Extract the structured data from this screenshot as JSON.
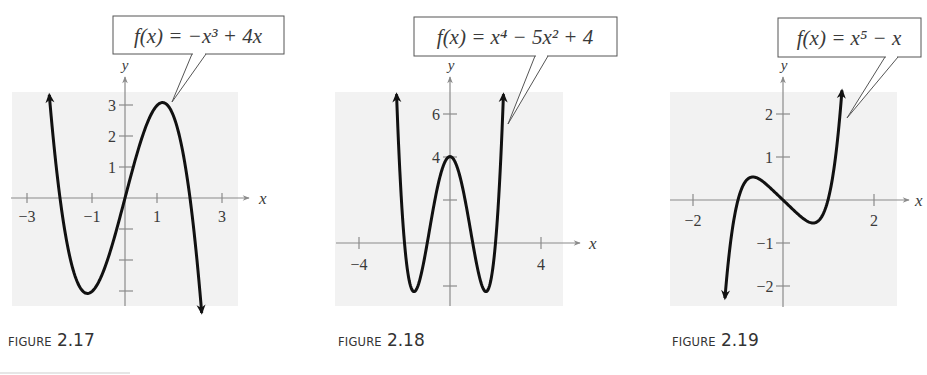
{
  "figures": [
    {
      "caption_word": "FIGURE",
      "caption_number": "2.17",
      "equation_label": "f(x) = −x³ + 4x",
      "axis_labels": {
        "x": "x",
        "y": "y"
      },
      "x_ticks": [
        "−3",
        "−1",
        "1",
        "3"
      ],
      "y_ticks": [
        "3",
        "2",
        "1"
      ]
    },
    {
      "caption_word": "FIGURE",
      "caption_number": "2.18",
      "equation_label": "f(x) = x⁴ − 5x² + 4",
      "axis_labels": {
        "x": "x",
        "y": "y"
      },
      "x_ticks": [
        "−4",
        "4"
      ],
      "y_ticks": [
        "6",
        "4"
      ]
    },
    {
      "caption_word": "FIGURE",
      "caption_number": "2.19",
      "equation_label": "f(x) = x⁵ − x",
      "axis_labels": {
        "x": "x",
        "y": "y"
      },
      "x_ticks": [
        "−2",
        "2"
      ],
      "y_ticks": [
        "2",
        "1",
        "−1",
        "−2"
      ]
    }
  ],
  "colors": {
    "plot_background": "#f2f2f2",
    "axis": "#8a8a8a",
    "curve": "#111111",
    "text": "#3a3a3a"
  },
  "chart_data": [
    {
      "type": "line",
      "title": "FIGURE 2.17",
      "function": "f(x) = -x^3 + 4x",
      "xlabel": "x",
      "ylabel": "y",
      "xlim": [
        -3.5,
        3.5
      ],
      "ylim": [
        -3.5,
        3.5
      ],
      "x_tick_labels": [
        -3,
        -1,
        1,
        3
      ],
      "x_ticks": [
        -3,
        -2,
        -1,
        1,
        2,
        3
      ],
      "y_tick_labels": [
        1,
        2,
        3
      ],
      "y_ticks": [
        -3,
        -2,
        -1,
        1,
        2,
        3
      ],
      "grid": false,
      "x": [
        -2.3,
        -2,
        -1.5,
        -1.155,
        -1,
        -0.5,
        0,
        0.5,
        1,
        1.155,
        1.5,
        2,
        2.35
      ],
      "y": [
        2.97,
        0,
        -2.625,
        -3.08,
        -3,
        -1.875,
        0,
        1.875,
        3,
        3.08,
        2.625,
        0,
        -3.58
      ],
      "annotations": [
        "f(x) = −x³ + 4x"
      ]
    },
    {
      "type": "line",
      "title": "FIGURE 2.18",
      "function": "f(x) = x^4 - 5x^2 + 4",
      "xlabel": "x",
      "ylabel": "y",
      "xlim": [
        -5,
        5
      ],
      "ylim": [
        -3,
        7
      ],
      "x_tick_labels": [
        -4,
        4
      ],
      "x_ticks": [
        -4,
        4
      ],
      "y_tick_labels": [
        4,
        6
      ],
      "y_ticks": [
        -2,
        2,
        4,
        6
      ],
      "grid": false,
      "x": [
        -2.35,
        -2,
        -1.58,
        -1,
        0,
        1,
        1.58,
        2,
        2.35
      ],
      "y": [
        6.89,
        0,
        -2.25,
        0,
        4,
        0,
        -2.25,
        0,
        6.89
      ],
      "annotations": [
        "f(x) = x⁴ − 5x² + 4"
      ]
    },
    {
      "type": "line",
      "title": "FIGURE 2.19",
      "function": "f(x) = x^5 - x",
      "xlabel": "x",
      "ylabel": "y",
      "xlim": [
        -2.5,
        2.5
      ],
      "ylim": [
        -2.5,
        2.5
      ],
      "x_tick_labels": [
        -2,
        2
      ],
      "x_ticks": [
        -2,
        2
      ],
      "y_tick_labels": [
        -2,
        -1,
        1,
        2
      ],
      "y_ticks": [
        -2,
        -1,
        1,
        2
      ],
      "grid": false,
      "x": [
        -1.3,
        -1,
        -0.669,
        0,
        0.669,
        1,
        1.3
      ],
      "y": [
        -2.41,
        0,
        0.535,
        0,
        -0.535,
        0,
        2.41
      ],
      "annotations": [
        "f(x) = x⁵ − x"
      ]
    }
  ]
}
